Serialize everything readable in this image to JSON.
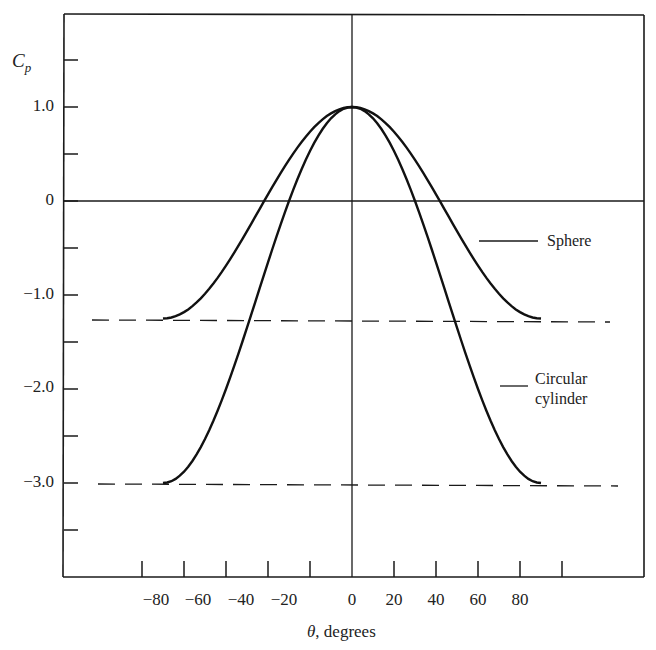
{
  "chart_data": {
    "type": "line",
    "title": "",
    "xlabel": "θ, degrees",
    "xlabel_symbol": "θ",
    "xlabel_text": ", degrees",
    "ylabel": "Cp",
    "ylabel_main": "C",
    "ylabel_sub": "p",
    "xlim": [
      -120,
      120
    ],
    "ylim": [
      -4.0,
      2.0
    ],
    "grid": false,
    "legend": "inline annotations",
    "x_ticks": [
      -100,
      -80,
      -60,
      -40,
      -20,
      0,
      20,
      40,
      60,
      80,
      100
    ],
    "x_tick_labels": [
      "-80",
      "-60",
      "-40",
      "-20",
      "0",
      "20",
      "40",
      "60",
      "80"
    ],
    "x_tick_label_values": [
      -80,
      -60,
      -40,
      -20,
      0,
      20,
      40,
      60,
      80
    ],
    "y_ticks": [
      1.5,
      1.0,
      0.5,
      0,
      -0.5,
      -1.0,
      -1.5,
      -2.0,
      -2.5,
      -3.0,
      -3.5
    ],
    "y_tick_labels": [
      "1.0",
      "0",
      "-1.0",
      "-2.0",
      "-3.0"
    ],
    "y_tick_label_values": [
      1.0,
      0,
      -1.0,
      -2.0,
      -3.0
    ],
    "x": [
      -90,
      -80,
      -70,
      -60,
      -50,
      -40,
      -30,
      -20,
      -10,
      0,
      10,
      20,
      30,
      40,
      50,
      60,
      70,
      80,
      90
    ],
    "series": [
      {
        "name": "Sphere",
        "formula": "Cp = 1 - 2.25 sin^2(theta)",
        "values": [
          -1.25,
          -1.18,
          -0.99,
          -0.69,
          -0.32,
          0.07,
          0.44,
          0.74,
          0.93,
          1.0,
          0.93,
          0.74,
          0.44,
          0.07,
          -0.32,
          -0.69,
          -0.99,
          -1.18,
          -1.25
        ]
      },
      {
        "name": "Circular cylinder",
        "formula": "Cp = 1 - 4 sin^2(theta)",
        "values": [
          -3.0,
          -2.88,
          -2.53,
          -2.0,
          -1.35,
          -0.65,
          0.0,
          0.53,
          0.88,
          1.0,
          0.88,
          0.53,
          0.0,
          -0.65,
          -1.35,
          -2.0,
          -2.53,
          -2.88,
          -3.0
        ]
      }
    ],
    "reference_lines": [
      {
        "type": "dashed",
        "y": -1.25,
        "label": "Sphere minimum"
      },
      {
        "type": "dashed",
        "y": -3.0,
        "label": "Cylinder minimum"
      }
    ],
    "annotations": [
      {
        "text": "Sphere",
        "series": "Sphere"
      },
      {
        "text": "Circular cylinder",
        "lines": [
          "Circular",
          "cylinder"
        ],
        "series": "Circular cylinder"
      }
    ]
  },
  "labels": {
    "ylabel_main": "C",
    "ylabel_sub": "p",
    "xlabel_symbol": "θ",
    "xlabel_text": ", degrees",
    "yticks": [
      "1.0",
      "0",
      "−1.0",
      "−2.0",
      "−3.0"
    ],
    "xticks": [
      "−80",
      "−60",
      "−40",
      "−20",
      "0",
      "20",
      "40",
      "60",
      "80"
    ],
    "sphere": "Sphere",
    "cylinder_line1": "Circular",
    "cylinder_line2": "cylinder"
  },
  "colors": {
    "ink": "#1a1a1a",
    "background": "#ffffff"
  }
}
